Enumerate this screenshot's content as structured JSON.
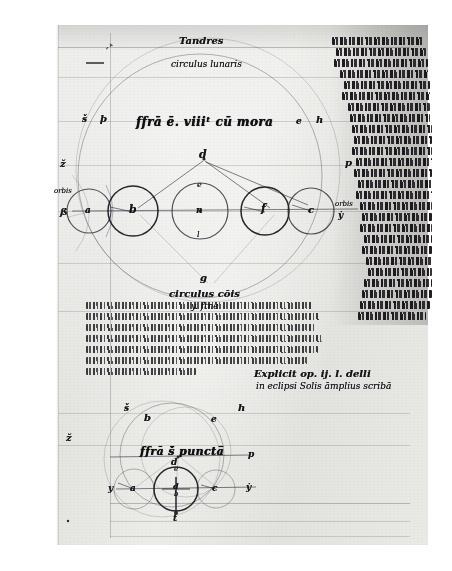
{
  "document": {
    "kind": "medieval-manuscript-folio",
    "script": "gothic-textualis-cursive",
    "language": "Latin (abbreviated)",
    "ink_color": "#17141b",
    "parchment_color": "#e8e8e5"
  },
  "headings": {
    "top_line_1": "Tandres",
    "top_line_2": "circulus lunaris",
    "main_title": "ffrā ē. viiiᵗ cū mora",
    "sub_label_1": "circulus cōis",
    "sub_label_2": "y. ftne",
    "lower_title": "ffrā š̄ punctā̄",
    "explicit_line_1": "Explicit op. ij. l. delli",
    "explicit_line_2": "in eclipsi Solis  āmplius scribā"
  },
  "upper_diagram": {
    "name": "eclipse-circle-diagram",
    "apex_label": "d",
    "circles": [
      {
        "label": "a",
        "cx": 89,
        "cy": 211,
        "r": 22
      },
      {
        "label": "b",
        "cx": 133,
        "cy": 211,
        "r": 25
      },
      {
        "label": "n",
        "cx": 200,
        "cy": 211,
        "r": 28
      },
      {
        "label": "f",
        "cx": 265,
        "cy": 211,
        "r": 24
      },
      {
        "label": "c",
        "cx": 311,
        "cy": 211,
        "r": 23
      }
    ],
    "point_labels": {
      "top_of_n": "e",
      "bottom_of_n": "l",
      "apex": "d",
      "bottom_apex": "g"
    },
    "margin_labels": {
      "left_upper": "ž",
      "left_mid": "orbis",
      "left_low": "ß",
      "title_left_1": "š",
      "title_left_2": "þ",
      "title_right_1": "e",
      "title_right_2": "h",
      "right_mid": "p",
      "right_circle": "orbis",
      "right_low": "ẏ"
    },
    "big_circle": {
      "cx": 200,
      "cy": 176,
      "r": 122
    }
  },
  "lower_diagram": {
    "name": "punctual-eclipse-diagram",
    "center_label": "d",
    "title": "ffrā š̄ punctā̄",
    "big_circles": [
      {
        "cx": 172,
        "cy": 455,
        "r": 52
      },
      {
        "cx": 186,
        "cy": 452,
        "r": 45
      }
    ],
    "small_circles": [
      {
        "label": "a",
        "cx": 133,
        "cy": 489,
        "r": 20
      },
      {
        "label": "d",
        "cx": 175,
        "cy": 489,
        "r": 22
      },
      {
        "label": "c",
        "cx": 215,
        "cy": 489,
        "r": 19
      }
    ],
    "point_labels": {
      "left_axis": "y",
      "right_axis": "ẏ",
      "upper_left": "š",
      "upper_left2": "b",
      "upper_right": "e",
      "upper_far_right": "h",
      "right": "p",
      "left_edge": "ž",
      "center_mark": "d",
      "below_center": "b",
      "bottom": "t",
      "above_center": "e"
    }
  },
  "margin_column": {
    "name": "right-margin-gloss",
    "line_count": 26,
    "first_words": "Ptolomē si se sciēt",
    "note": "dense abbreviated marginal commentary running down the right edge"
  },
  "main_text_block": {
    "name": "central-latin-paragraph",
    "line_count": 8,
    "incipit": "cuī angulus b est contra lineā in p̄̄mā move",
    "explicit": "solutum exit notum"
  },
  "ruling": {
    "vertical_line_x": 110,
    "horizontal_lines_visible": 9,
    "color": "#46464e"
  }
}
